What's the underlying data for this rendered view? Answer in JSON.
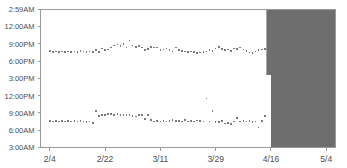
{
  "chart_title": "",
  "colors": {
    "point": "#7a7a7a",
    "axis": "#9a9a9a",
    "tick_text": "#4d4d4d",
    "shaded_region": "#6e6e6e",
    "background": "#ffffff"
  },
  "chart_data": {
    "type": "scatter",
    "title": "",
    "subtitle": "",
    "xlabel": "",
    "ylabel": "",
    "grid": false,
    "legend_position": "none",
    "x_axis": {
      "tick_labels": [
        "2/4",
        "2/22",
        "3/11",
        "3/29",
        "4/16",
        "5/4"
      ],
      "tick_values": [
        0,
        18,
        36,
        54,
        72,
        90
      ],
      "xlim": [
        -3,
        93
      ]
    },
    "y_axis": {
      "tick_labels": [
        "3:00AM",
        "6:00AM",
        "9:00AM",
        "12:00PM",
        "3:00PM",
        "6:00PM",
        "9:00PM",
        "12:00AM",
        "2:59AM"
      ],
      "tick_values": [
        3,
        6,
        9,
        12,
        15,
        18,
        21,
        24,
        26.983
      ],
      "ylim": [
        3,
        26.983
      ],
      "units": "hour of day (3:00AM to 2:59AM next day)"
    },
    "annotations": [
      {
        "type": "shaded-region",
        "label": "no-data region",
        "color": "#6e6e6e",
        "x_start": 70.5,
        "x_end": 93,
        "y_start": 3,
        "y_end": 26.983,
        "notch": {
          "x_start": 70.5,
          "x_end": 72.0,
          "y_start": 3,
          "y_end": 15.6
        }
      }
    ],
    "series": [
      {
        "name": "bedtime",
        "marker": "square",
        "color": "#7a7a7a",
        "x": [
          0,
          1,
          2,
          3,
          4,
          5,
          6,
          7,
          8,
          9,
          10,
          11,
          12,
          13,
          14,
          15,
          16,
          17,
          18,
          19,
          20,
          21,
          22,
          23,
          24,
          25,
          26,
          27,
          28,
          29,
          30,
          31,
          32,
          33,
          34,
          35,
          36,
          37,
          38,
          39,
          40,
          41,
          42,
          43,
          44,
          45,
          46,
          47,
          48,
          49,
          50,
          51,
          52,
          53,
          54,
          55,
          56,
          57,
          58,
          59,
          60,
          61,
          62,
          63,
          64,
          65,
          66,
          67,
          68,
          69,
          70
        ],
        "y": [
          19.8,
          19.6,
          19.7,
          19.6,
          19.7,
          19.6,
          19.7,
          19.6,
          19.7,
          19.6,
          19.8,
          19.7,
          19.6,
          19.7,
          19.6,
          19.9,
          19.6,
          20.2,
          19.9,
          20.0,
          20.4,
          20.7,
          20.9,
          20.6,
          21.0,
          20.4,
          21.6,
          20.7,
          20.5,
          20.6,
          20.4,
          19.9,
          20.1,
          20.5,
          20.4,
          20.4,
          19.9,
          20.0,
          20.2,
          19.9,
          19.7,
          20.4,
          19.9,
          19.8,
          19.7,
          19.6,
          19.7,
          19.6,
          19.4,
          19.5,
          19.6,
          19.7,
          19.9,
          19.8,
          20.2,
          20.5,
          20.1,
          19.9,
          20.0,
          19.8,
          20.2,
          20.1,
          20.4,
          20.0,
          19.8,
          19.5,
          19.4,
          19.7,
          19.9,
          20.0,
          20.1
        ]
      },
      {
        "name": "wake time",
        "marker": "square",
        "color": "#7a7a7a",
        "x": [
          0,
          1,
          2,
          3,
          4,
          5,
          6,
          7,
          8,
          9,
          10,
          11,
          12,
          13,
          14,
          15,
          16,
          17,
          18,
          19,
          20,
          21,
          22,
          23,
          24,
          25,
          26,
          27,
          28,
          29,
          30,
          31,
          32,
          33,
          34,
          35,
          36,
          37,
          38,
          39,
          40,
          41,
          42,
          43,
          44,
          45,
          46,
          47,
          48,
          49,
          50,
          51,
          52,
          53,
          54,
          55,
          56,
          57,
          58,
          59,
          60,
          61,
          62,
          63,
          64,
          65,
          66,
          67,
          68,
          69,
          70
        ],
        "y": [
          7.6,
          7.5,
          7.6,
          7.5,
          7.6,
          7.5,
          7.6,
          7.5,
          7.6,
          7.5,
          7.6,
          7.5,
          7.4,
          7.5,
          7.3,
          9.3,
          8.5,
          8.6,
          8.7,
          8.8,
          8.8,
          8.7,
          8.8,
          8.7,
          8.6,
          8.7,
          8.7,
          8.5,
          8.4,
          8.6,
          8.7,
          8.0,
          8.7,
          7.8,
          7.5,
          7.6,
          7.5,
          7.6,
          7.5,
          7.6,
          7.8,
          7.6,
          7.6,
          7.5,
          7.8,
          7.5,
          7.6,
          7.5,
          7.7,
          7.6,
          7.5,
          11.5,
          7.5,
          9.3,
          7.4,
          7.4,
          7.6,
          7.2,
          7.3,
          7.1,
          7.5,
          8.1,
          7.5,
          7.6,
          7.5,
          7.6,
          7.4,
          7.5,
          6.5,
          7.6,
          8.5
        ]
      }
    ]
  }
}
